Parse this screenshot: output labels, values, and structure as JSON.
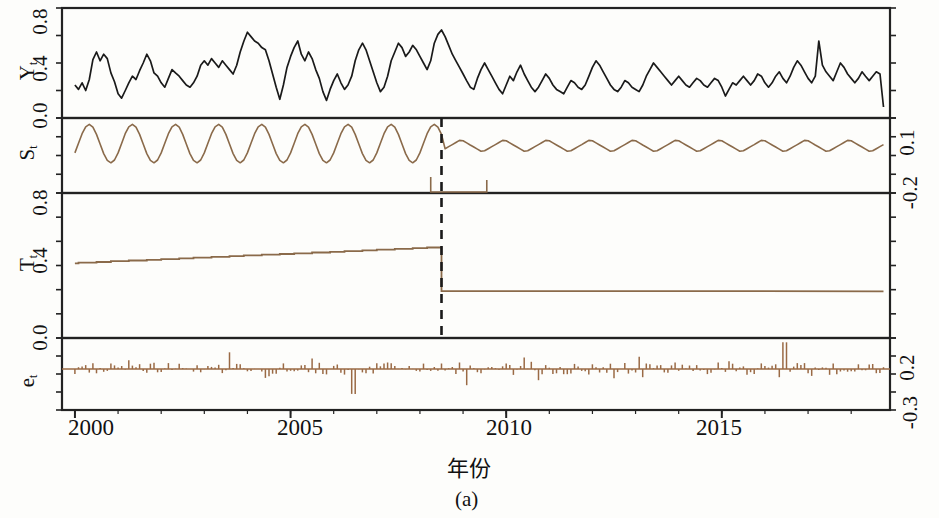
{
  "figure": {
    "caption": "(a)",
    "xlabel": "年份"
  },
  "axes": {
    "x_ticks": [
      "2000",
      "2005",
      "2010",
      "2015"
    ],
    "x_tick_values": [
      2000,
      2005,
      2010,
      2015
    ],
    "panel_labels": [
      "Y",
      "S",
      "T",
      "e"
    ],
    "panel_label_sub": "t",
    "y_left_Y": [
      "0.8",
      "0.4",
      "0.0"
    ],
    "y_left_T": [
      "0.8",
      "0.4",
      "0.0"
    ],
    "y_right_S": [
      "0.1",
      "-0.2"
    ],
    "y_right_e": [
      "0.2",
      "-0.3"
    ]
  },
  "style": {
    "line_color_black": "#1a1a1a",
    "line_color_brown": "#8a6a4a",
    "residual_color": "#9a6a45",
    "frame_color": "#222222",
    "break_line_color": "#1a1a1a"
  },
  "chart_data": {
    "type": "line",
    "title": "",
    "xlabel": "年份",
    "ylabel": "",
    "xlim": [
      1999.7,
      2018.9
    ],
    "grid": false,
    "legend": "none",
    "break_year": 2008.5,
    "panels": [
      {
        "name": "Y_t",
        "label": "Y",
        "sublabel": "t",
        "type": "line",
        "color": "#1a1a1a",
        "axis_side": "left",
        "ylim": [
          -0.08,
          0.92
        ],
        "yticks": [
          0.0,
          0.4,
          0.8
        ],
        "ytick_labels": [
          "0.0",
          "0.4",
          "0.8"
        ],
        "description": "Observed monthly series; strong high-amplitude seasonality before 2008.5, lower amplitude after.",
        "x": [
          2000.0,
          2000.083,
          2000.167,
          2000.25,
          2000.333,
          2000.417,
          2000.5,
          2000.583,
          2000.667,
          2000.75,
          2000.833,
          2000.917,
          2001.0,
          2001.083,
          2001.167,
          2001.25,
          2001.333,
          2001.417,
          2001.5,
          2001.583,
          2001.667,
          2001.75,
          2001.833,
          2001.917,
          2002.0,
          2002.083,
          2002.167,
          2002.25,
          2002.333,
          2002.417,
          2002.5,
          2002.583,
          2002.667,
          2002.75,
          2002.833,
          2002.917,
          2003.0,
          2003.083,
          2003.167,
          2003.25,
          2003.333,
          2003.417,
          2003.5,
          2003.583,
          2003.667,
          2003.75,
          2003.833,
          2003.917,
          2004.0,
          2004.083,
          2004.167,
          2004.25,
          2004.333,
          2004.417,
          2004.5,
          2004.583,
          2004.667,
          2004.75,
          2004.833,
          2004.917,
          2005.0,
          2005.083,
          2005.167,
          2005.25,
          2005.333,
          2005.417,
          2005.5,
          2005.583,
          2005.667,
          2005.75,
          2005.833,
          2005.917,
          2006.0,
          2006.083,
          2006.167,
          2006.25,
          2006.333,
          2006.417,
          2006.5,
          2006.583,
          2006.667,
          2006.75,
          2006.833,
          2006.917,
          2007.0,
          2007.083,
          2007.167,
          2007.25,
          2007.333,
          2007.417,
          2007.5,
          2007.583,
          2007.667,
          2007.75,
          2007.833,
          2007.917,
          2008.0,
          2008.083,
          2008.167,
          2008.25,
          2008.333,
          2008.417,
          2008.5,
          2008.583,
          2008.667,
          2008.75,
          2008.833,
          2008.917,
          2009.0,
          2009.083,
          2009.167,
          2009.25,
          2009.333,
          2009.417,
          2009.5,
          2009.583,
          2009.667,
          2009.75,
          2009.833,
          2009.917,
          2010.0,
          2010.083,
          2010.167,
          2010.25,
          2010.333,
          2010.417,
          2010.5,
          2010.583,
          2010.667,
          2010.75,
          2010.833,
          2010.917,
          2011.0,
          2011.083,
          2011.167,
          2011.25,
          2011.333,
          2011.417,
          2011.5,
          2011.583,
          2011.667,
          2011.75,
          2011.833,
          2011.917,
          2012.0,
          2012.083,
          2012.167,
          2012.25,
          2012.333,
          2012.417,
          2012.5,
          2012.583,
          2012.667,
          2012.75,
          2012.833,
          2012.917,
          2013.0,
          2013.083,
          2013.167,
          2013.25,
          2013.333,
          2013.417,
          2013.5,
          2013.583,
          2013.667,
          2013.75,
          2013.833,
          2013.917,
          2014.0,
          2014.083,
          2014.167,
          2014.25,
          2014.333,
          2014.417,
          2014.5,
          2014.583,
          2014.667,
          2014.75,
          2014.833,
          2014.917,
          2015.0,
          2015.083,
          2015.167,
          2015.25,
          2015.333,
          2015.417,
          2015.5,
          2015.583,
          2015.667,
          2015.75,
          2015.833,
          2015.917,
          2016.0,
          2016.083,
          2016.167,
          2016.25,
          2016.333,
          2016.417,
          2016.5,
          2016.583,
          2016.667,
          2016.75,
          2016.833,
          2016.917,
          2017.0,
          2017.083,
          2017.167,
          2017.25,
          2017.333,
          2017.417,
          2017.5,
          2017.583,
          2017.667,
          2017.75,
          2017.833,
          2017.917,
          2018.0,
          2018.083,
          2018.167,
          2018.25,
          2018.333,
          2018.417,
          2018.5,
          2018.583,
          2018.667,
          2018.75
        ],
        "y": [
          0.22,
          0.18,
          0.24,
          0.17,
          0.27,
          0.45,
          0.52,
          0.44,
          0.5,
          0.46,
          0.33,
          0.25,
          0.14,
          0.1,
          0.17,
          0.24,
          0.3,
          0.27,
          0.35,
          0.42,
          0.5,
          0.44,
          0.33,
          0.3,
          0.24,
          0.2,
          0.28,
          0.36,
          0.33,
          0.3,
          0.26,
          0.22,
          0.2,
          0.24,
          0.3,
          0.4,
          0.44,
          0.4,
          0.46,
          0.42,
          0.38,
          0.44,
          0.4,
          0.36,
          0.32,
          0.4,
          0.52,
          0.62,
          0.7,
          0.66,
          0.62,
          0.6,
          0.56,
          0.54,
          0.44,
          0.32,
          0.2,
          0.09,
          0.22,
          0.38,
          0.48,
          0.56,
          0.62,
          0.5,
          0.44,
          0.52,
          0.46,
          0.36,
          0.28,
          0.16,
          0.08,
          0.18,
          0.26,
          0.32,
          0.24,
          0.18,
          0.22,
          0.3,
          0.44,
          0.54,
          0.6,
          0.54,
          0.44,
          0.34,
          0.24,
          0.16,
          0.2,
          0.3,
          0.44,
          0.52,
          0.6,
          0.56,
          0.48,
          0.52,
          0.58,
          0.54,
          0.48,
          0.42,
          0.36,
          0.44,
          0.6,
          0.68,
          0.72,
          0.66,
          0.58,
          0.5,
          0.44,
          0.38,
          0.32,
          0.26,
          0.2,
          0.18,
          0.28,
          0.36,
          0.42,
          0.36,
          0.3,
          0.24,
          0.18,
          0.14,
          0.22,
          0.3,
          0.26,
          0.34,
          0.4,
          0.32,
          0.26,
          0.2,
          0.16,
          0.2,
          0.26,
          0.32,
          0.28,
          0.22,
          0.18,
          0.16,
          0.14,
          0.2,
          0.26,
          0.24,
          0.2,
          0.18,
          0.22,
          0.3,
          0.38,
          0.44,
          0.4,
          0.34,
          0.28,
          0.22,
          0.18,
          0.16,
          0.2,
          0.26,
          0.24,
          0.2,
          0.18,
          0.16,
          0.22,
          0.3,
          0.36,
          0.42,
          0.38,
          0.34,
          0.3,
          0.26,
          0.22,
          0.26,
          0.3,
          0.26,
          0.22,
          0.2,
          0.24,
          0.28,
          0.26,
          0.22,
          0.2,
          0.24,
          0.28,
          0.26,
          0.2,
          0.12,
          0.18,
          0.24,
          0.22,
          0.26,
          0.3,
          0.26,
          0.22,
          0.26,
          0.32,
          0.3,
          0.24,
          0.2,
          0.24,
          0.3,
          0.34,
          0.28,
          0.24,
          0.3,
          0.38,
          0.44,
          0.4,
          0.34,
          0.28,
          0.24,
          0.3,
          0.62,
          0.4,
          0.34,
          0.3,
          0.26,
          0.34,
          0.42,
          0.38,
          0.32,
          0.28,
          0.24,
          0.28,
          0.34,
          0.3,
          0.26,
          0.3,
          0.34,
          0.32,
          0.02
        ]
      },
      {
        "name": "S_t",
        "label": "S",
        "sublabel": "t",
        "type": "line",
        "color": "#8a6a4a",
        "axis_side": "right",
        "ylim": [
          -0.27,
          0.14
        ],
        "yticks": [
          0.1,
          -0.2
        ],
        "ytick_labels": [
          "0.1",
          "-0.2"
        ],
        "description": "Seasonal component. Amplitude about 0.20 (peak-to-trough) before the 2008.5 break, about 0.07 after.",
        "amplitude_before": 0.105,
        "amplitude_after": 0.034,
        "period_years": 1.0,
        "mean_before": 0.0,
        "mean_after": -0.012
      },
      {
        "name": "T_t",
        "label": "T",
        "sublabel": "t",
        "type": "step",
        "color": "#8a6a4a",
        "axis_side": "left",
        "ylim": [
          -0.05,
          0.86
        ],
        "yticks": [
          0.0,
          0.4,
          0.8
        ],
        "ytick_labels": [
          "0.0",
          "0.4",
          "0.8"
        ],
        "description": "Trend component, slowly rising step function before the break then a sharp level drop at 2008.5 and flat afterwards.",
        "value_start": 0.42,
        "value_at_break": 0.52,
        "value_after_break": 0.245,
        "value_end": 0.243
      },
      {
        "name": "e_t",
        "label": "e",
        "sublabel": "t",
        "type": "bar",
        "color": "#9a6a45",
        "axis_side": "right",
        "ylim": [
          -0.33,
          0.25
        ],
        "yticks": [
          0.2,
          -0.3
        ],
        "ytick_labels": [
          "0.2",
          "-0.3"
        ],
        "description": "Residual component drawn as vertical spikes about zero; largest negative spike near 2006.5, largest positive spike near 2016.5.",
        "mean": 0.0,
        "typical_range": [
          -0.08,
          0.08
        ],
        "max": 0.22,
        "min": -0.2
      }
    ]
  }
}
